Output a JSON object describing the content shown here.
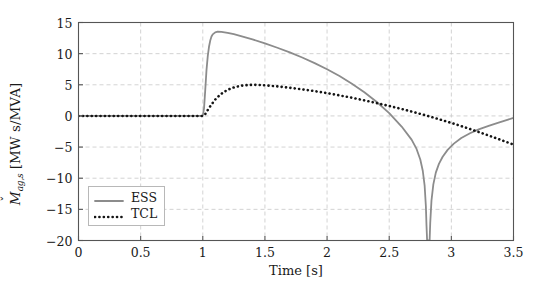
{
  "chart_data": {
    "type": "line",
    "title": "",
    "xlabel": "Time [s]",
    "ylabel": "M̌ [MW s/MVA]",
    "ylabel_symbol": "M",
    "ylabel_accent": "caron",
    "ylabel_subscript": "ag,s",
    "ylabel_unit": "[MW s/MVA]",
    "xlim": [
      0,
      3.5
    ],
    "ylim": [
      -20,
      15
    ],
    "xticks": [
      0,
      0.5,
      1,
      1.5,
      2,
      2.5,
      3,
      3.5
    ],
    "xtick_labels": [
      "0",
      "0.5",
      "1",
      "1.5",
      "2",
      "2.5",
      "3",
      "3.5"
    ],
    "yticks": [
      -20,
      -15,
      -10,
      -5,
      0,
      5,
      10,
      15
    ],
    "ytick_labels": [
      "−20",
      "−15",
      "−10",
      "−5",
      "0",
      "5",
      "10",
      "15"
    ],
    "grid": true,
    "grid_style": "dashed",
    "grid_color": "#c8c8c8",
    "legend_position": "lower-left",
    "series": [
      {
        "name": "ESS",
        "style": "solid",
        "color": "#8c8c8c",
        "width": 1.8,
        "points": [
          [
            0.0,
            0.0
          ],
          [
            0.2,
            0.0
          ],
          [
            0.4,
            0.0
          ],
          [
            0.6,
            0.0
          ],
          [
            0.8,
            0.0
          ],
          [
            0.95,
            0.0
          ],
          [
            1.0,
            0.0
          ],
          [
            1.01,
            1.2
          ],
          [
            1.02,
            4.2
          ],
          [
            1.03,
            7.4
          ],
          [
            1.04,
            9.6
          ],
          [
            1.05,
            11.1
          ],
          [
            1.06,
            12.1
          ],
          [
            1.07,
            12.75
          ],
          [
            1.08,
            13.1
          ],
          [
            1.1,
            13.42
          ],
          [
            1.12,
            13.52
          ],
          [
            1.15,
            13.5
          ],
          [
            1.2,
            13.34
          ],
          [
            1.25,
            13.12
          ],
          [
            1.3,
            12.86
          ],
          [
            1.4,
            12.28
          ],
          [
            1.5,
            11.64
          ],
          [
            1.6,
            10.95
          ],
          [
            1.7,
            10.2
          ],
          [
            1.8,
            9.38
          ],
          [
            1.9,
            8.48
          ],
          [
            2.0,
            7.5
          ],
          [
            2.1,
            6.4
          ],
          [
            2.2,
            5.18
          ],
          [
            2.3,
            3.8
          ],
          [
            2.4,
            2.24
          ],
          [
            2.5,
            0.44
          ],
          [
            2.6,
            -1.7
          ],
          [
            2.68,
            -3.8
          ],
          [
            2.72,
            -5.3
          ],
          [
            2.75,
            -7.0
          ],
          [
            2.77,
            -8.8
          ],
          [
            2.785,
            -11.2
          ],
          [
            2.795,
            -14.5
          ],
          [
            2.8,
            -17.6
          ],
          [
            2.805,
            -20.0
          ],
          [
            2.825,
            -20.0
          ],
          [
            2.83,
            -17.2
          ],
          [
            2.84,
            -13.6
          ],
          [
            2.855,
            -11.0
          ],
          [
            2.875,
            -9.1
          ],
          [
            2.9,
            -7.7
          ],
          [
            2.93,
            -6.55
          ],
          [
            2.97,
            -5.45
          ],
          [
            3.02,
            -4.45
          ],
          [
            3.08,
            -3.55
          ],
          [
            3.15,
            -2.78
          ],
          [
            3.22,
            -2.15
          ],
          [
            3.3,
            -1.6
          ],
          [
            3.38,
            -1.08
          ],
          [
            3.45,
            -0.62
          ],
          [
            3.5,
            -0.32
          ]
        ]
      },
      {
        "name": "TCL",
        "style": "dotted",
        "color": "#141414",
        "width": 2.6,
        "points": [
          [
            0.0,
            0.0
          ],
          [
            0.2,
            0.0
          ],
          [
            0.4,
            0.0
          ],
          [
            0.6,
            0.0
          ],
          [
            0.8,
            0.0
          ],
          [
            0.95,
            0.0
          ],
          [
            1.0,
            0.0
          ],
          [
            1.02,
            0.3
          ],
          [
            1.04,
            0.95
          ],
          [
            1.06,
            1.55
          ],
          [
            1.08,
            2.1
          ],
          [
            1.1,
            2.62
          ],
          [
            1.13,
            3.22
          ],
          [
            1.16,
            3.72
          ],
          [
            1.2,
            4.2
          ],
          [
            1.25,
            4.58
          ],
          [
            1.3,
            4.82
          ],
          [
            1.35,
            4.95
          ],
          [
            1.4,
            5.0
          ],
          [
            1.45,
            4.98
          ],
          [
            1.5,
            4.92
          ],
          [
            1.6,
            4.74
          ],
          [
            1.7,
            4.52
          ],
          [
            1.8,
            4.26
          ],
          [
            1.9,
            3.98
          ],
          [
            2.0,
            3.66
          ],
          [
            2.1,
            3.3
          ],
          [
            2.2,
            2.92
          ],
          [
            2.3,
            2.5
          ],
          [
            2.4,
            2.06
          ],
          [
            2.5,
            1.6
          ],
          [
            2.6,
            1.12
          ],
          [
            2.7,
            0.6
          ],
          [
            2.8,
            0.06
          ],
          [
            2.9,
            -0.52
          ],
          [
            3.0,
            -1.12
          ],
          [
            3.1,
            -1.76
          ],
          [
            3.2,
            -2.44
          ],
          [
            3.3,
            -3.14
          ],
          [
            3.4,
            -3.86
          ],
          [
            3.5,
            -4.6
          ]
        ]
      }
    ],
    "legend": [
      {
        "label": "ESS",
        "style": "solid",
        "color": "#8c8c8c"
      },
      {
        "label": "TCL",
        "style": "dotted",
        "color": "#141414"
      }
    ]
  },
  "axes_frame_color": "#555555"
}
